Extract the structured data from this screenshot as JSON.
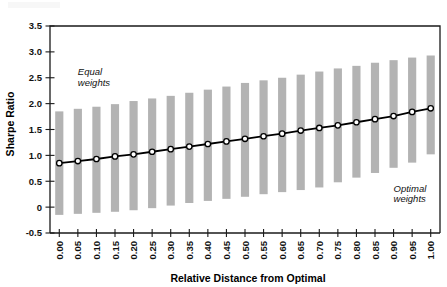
{
  "chart_data": {
    "type": "bar",
    "title": "",
    "subtitle": "",
    "xlabel": "Relative Distance from Optimal",
    "ylabel": "Sharpe Ratio",
    "xlim": [
      -0.5,
      20.5
    ],
    "ylim": [
      -0.5,
      3.5
    ],
    "grid": false,
    "legend_position": "none",
    "categories": [
      "0.00",
      "0.05",
      "0.10",
      "0.15",
      "0.20",
      "0.25",
      "0.30",
      "0.35",
      "0.40",
      "0.45",
      "0.50",
      "0.55",
      "0.60",
      "0.65",
      "0.70",
      "0.75",
      "0.80",
      "0.85",
      "0.90",
      "0.95",
      "1.00"
    ],
    "x_tick_labels": [
      "0.00",
      "0.05",
      "0.10",
      "0.15",
      "0.20",
      "0.25",
      "0.30",
      "0.35",
      "0.40",
      "0.45",
      "0.50",
      "0.55",
      "0.60",
      "0.65",
      "0.70",
      "0.75",
      "0.80",
      "0.85",
      "0.90",
      "0.95",
      "1.00"
    ],
    "y_tick_labels": [
      "3.5",
      "3.0",
      "2.5",
      "2.0",
      "1.5",
      "1.0",
      "0.5",
      "0",
      "-0.5"
    ],
    "y_tick_values": [
      3.5,
      3.0,
      2.5,
      2.0,
      1.5,
      1.0,
      0.5,
      0,
      -0.5
    ],
    "series": [
      {
        "name": "Sharpe ratio range",
        "type": "range-bar",
        "color": "#b3b3b3",
        "low": [
          -0.15,
          -0.13,
          -0.11,
          -0.09,
          -0.06,
          -0.02,
          0.03,
          0.08,
          0.12,
          0.16,
          0.2,
          0.25,
          0.29,
          0.33,
          0.38,
          0.48,
          0.57,
          0.66,
          0.76,
          0.86,
          1.02
        ],
        "high": [
          1.85,
          1.9,
          1.94,
          1.99,
          2.05,
          2.1,
          2.15,
          2.21,
          2.27,
          2.33,
          2.4,
          2.45,
          2.5,
          2.56,
          2.62,
          2.68,
          2.73,
          2.79,
          2.84,
          2.89,
          2.93
        ]
      },
      {
        "name": "Mean Sharpe ratio",
        "type": "line",
        "color": "#000000",
        "marker": "circle-open",
        "values": [
          0.85,
          0.89,
          0.93,
          0.98,
          1.02,
          1.07,
          1.12,
          1.17,
          1.22,
          1.27,
          1.32,
          1.37,
          1.42,
          1.48,
          1.53,
          1.58,
          1.64,
          1.7,
          1.76,
          1.84,
          1.91
        ]
      }
    ],
    "annotations": [
      {
        "text_line1": "Equal",
        "text_line2": "weights",
        "x_category": "0.05",
        "y_value": 2.55,
        "style": "italic"
      },
      {
        "text_line1": "Optimal",
        "text_line2": "weights",
        "x_category": "0.90",
        "y_value": 0.3,
        "style": "italic"
      }
    ],
    "colors": {
      "bar": "#b3b3b3",
      "line": "#000000",
      "marker_fill": "#ffffff",
      "axis": "#1a1a1a",
      "background": "#ffffff"
    }
  }
}
